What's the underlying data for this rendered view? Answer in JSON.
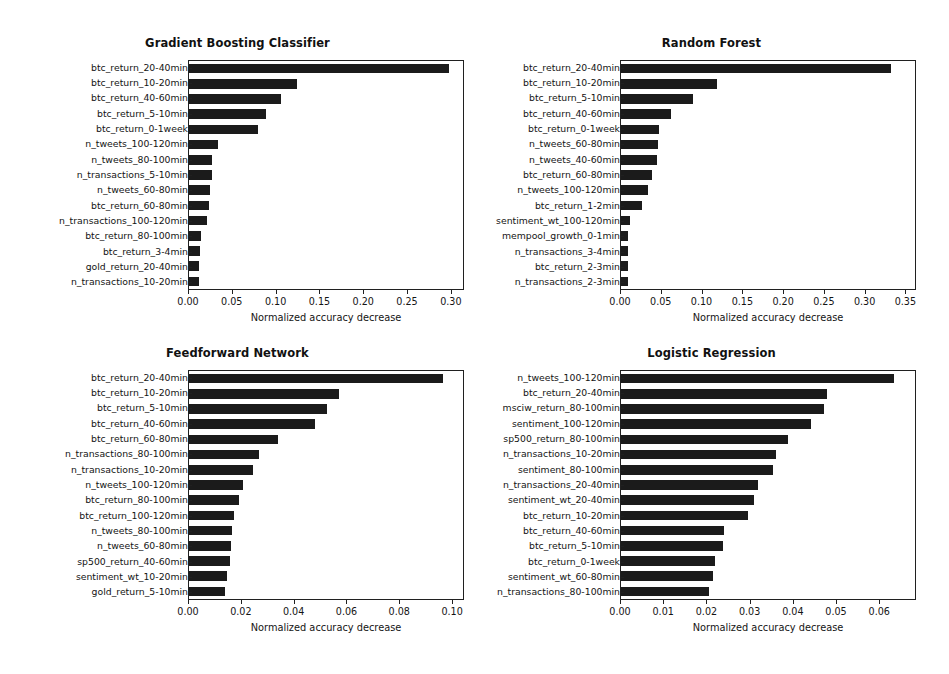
{
  "figure": {
    "width": 949,
    "height": 674,
    "background": "#ffffff",
    "bar_color": "#1b1b1b",
    "axis_color": "#202020"
  },
  "chart_data": [
    {
      "type": "bar",
      "orientation": "horizontal",
      "title": "Gradient Boosting Classifier",
      "xlabel": "Normalized accuracy decrease",
      "ylabel": "",
      "xlim": [
        0.0,
        0.315
      ],
      "xticks": [
        0.0,
        0.05,
        0.1,
        0.15,
        0.2,
        0.25,
        0.3
      ],
      "xticklabels": [
        "0.00",
        "0.05",
        "0.10",
        "0.15",
        "0.20",
        "0.25",
        "0.30"
      ],
      "grid": false,
      "legend": "none",
      "categories": [
        "btc_return_20-40min",
        "btc_return_10-20min",
        "btc_return_40-60min",
        "btc_return_5-10min",
        "btc_return_0-1week",
        "n_tweets_100-120min",
        "n_tweets_80-100min",
        "n_transactions_5-10min",
        "n_tweets_60-80min",
        "btc_return_60-80min",
        "n_transactions_100-120min",
        "btc_return_80-100min",
        "btc_return_3-4min",
        "gold_return_20-40min",
        "n_transactions_10-20min"
      ],
      "values": [
        0.2985,
        0.1245,
        0.1055,
        0.088,
        0.0795,
        0.033,
        0.027,
        0.0262,
        0.0245,
        0.023,
        0.0205,
        0.014,
        0.0122,
        0.011,
        0.011
      ]
    },
    {
      "type": "bar",
      "orientation": "horizontal",
      "title": "Random Forest",
      "xlabel": "Normalized accuracy decrease",
      "ylabel": "",
      "xlim": [
        0.0,
        0.363
      ],
      "xticks": [
        0.0,
        0.05,
        0.1,
        0.15,
        0.2,
        0.25,
        0.3,
        0.35
      ],
      "xticklabels": [
        "0.00",
        "0.05",
        "0.10",
        "0.15",
        "0.20",
        "0.25",
        "0.30",
        "0.35"
      ],
      "grid": false,
      "legend": "none",
      "categories": [
        "btc_return_20-40min",
        "btc_return_10-20min",
        "btc_return_5-10min",
        "btc_return_40-60min",
        "btc_return_0-1week",
        "n_tweets_60-80min",
        "n_tweets_40-60min",
        "btc_return_60-80min",
        "n_tweets_100-120min",
        "btc_return_1-2min",
        "sentiment_wt_100-120min",
        "mempool_growth_0-1min",
        "n_transactions_3-4min",
        "btc_return_2-3min",
        "n_transactions_2-3min"
      ],
      "values": [
        0.333,
        0.1185,
        0.089,
        0.0615,
        0.047,
        0.0455,
        0.045,
        0.0385,
        0.033,
        0.0265,
        0.0115,
        0.009,
        0.0092,
        0.0092,
        0.0088
      ]
    },
    {
      "type": "bar",
      "orientation": "horizontal",
      "title": "Feedforward Network",
      "xlabel": "Normalized accuracy decrease",
      "ylabel": "",
      "xlim": [
        0.0,
        0.1045
      ],
      "xticks": [
        0.0,
        0.02,
        0.04,
        0.06,
        0.08,
        0.1
      ],
      "xticklabels": [
        "0.00",
        "0.02",
        "0.04",
        "0.06",
        "0.08",
        "0.10"
      ],
      "grid": false,
      "legend": "none",
      "categories": [
        "btc_return_20-40min",
        "btc_return_10-20min",
        "btc_return_5-10min",
        "btc_return_40-60min",
        "btc_return_60-80min",
        "n_transactions_80-100min",
        "n_transactions_10-20min",
        "n_tweets_100-120min",
        "btc_return_80-100min",
        "btc_return_100-120min",
        "n_tweets_80-100min",
        "n_tweets_60-80min",
        "sp500_return_40-60min",
        "sentiment_wt_10-20min",
        "gold_return_5-10min"
      ],
      "values": [
        0.097,
        0.0572,
        0.0528,
        0.048,
        0.034,
        0.0268,
        0.0243,
        0.0205,
        0.019,
        0.0172,
        0.0163,
        0.016,
        0.0155,
        0.0145,
        0.0137
      ]
    },
    {
      "type": "bar",
      "orientation": "horizontal",
      "title": "Logistic Regression",
      "xlabel": "Normalized accuracy decrease",
      "ylabel": "",
      "xlim": [
        0.0,
        0.0685
      ],
      "xticks": [
        0.0,
        0.01,
        0.02,
        0.03,
        0.04,
        0.05,
        0.06
      ],
      "xticklabels": [
        "0.00",
        "0.01",
        "0.02",
        "0.03",
        "0.04",
        "0.05",
        "0.06"
      ],
      "grid": false,
      "legend": "none",
      "categories": [
        "n_tweets_100-120min",
        "btc_return_20-40min",
        "msciw_return_80-100min",
        "sentiment_100-120min",
        "sp500_return_80-100min",
        "n_transactions_10-20min",
        "sentiment_80-100min",
        "n_transactions_20-40min",
        "sentiment_wt_20-40min",
        "btc_return_10-20min",
        "btc_return_40-60min",
        "btc_return_5-10min",
        "btc_return_0-1week",
        "sentiment_wt_60-80min",
        "n_transactions_80-100min"
      ],
      "values": [
        0.0635,
        0.048,
        0.0473,
        0.0443,
        0.0388,
        0.036,
        0.0355,
        0.032,
        0.031,
        0.0296,
        0.024,
        0.0238,
        0.0219,
        0.0215,
        0.0205
      ]
    }
  ]
}
